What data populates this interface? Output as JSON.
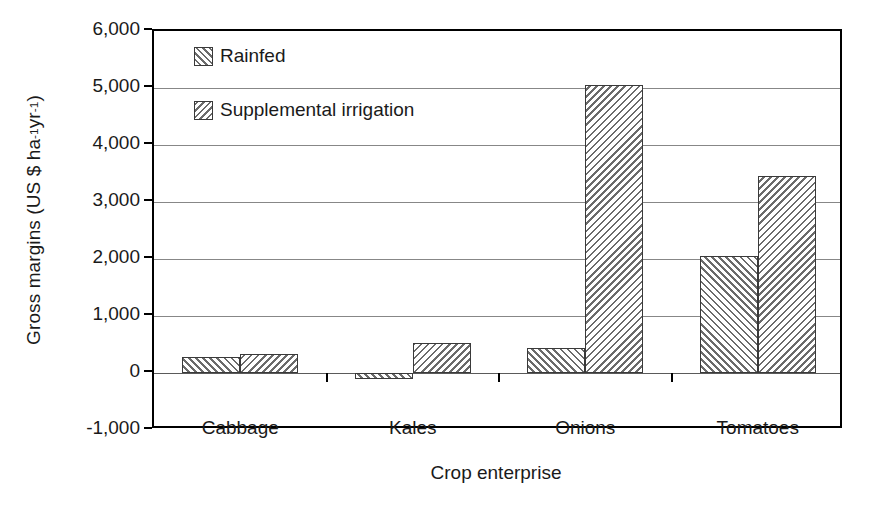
{
  "chart_data": {
    "type": "bar",
    "title": "",
    "xlabel": "Crop enterprise",
    "ylabel": "Gross margins (US $ ha-1 yr-1)",
    "ylabel_parts": {
      "prefix": "Gross margins (US $ ha",
      "sup1": "-1",
      "mid": " yr",
      "sup2": "-1",
      "suffix": ")"
    },
    "categories": [
      "Cabbage",
      "Kales",
      "Onions",
      "Tomatoes"
    ],
    "series": [
      {
        "name": "Rainfed",
        "values": [
          280,
          -110,
          440,
          2060
        ]
      },
      {
        "name": "Supplemental irrigation",
        "values": [
          340,
          520,
          5060,
          3450
        ]
      }
    ],
    "ylim": [
      -1000,
      6000
    ],
    "ytick_values": [
      -1000,
      0,
      1000,
      2000,
      3000,
      4000,
      5000,
      6000
    ],
    "ytick_labels": [
      "-1,000",
      "0",
      "1,000",
      "2,000",
      "3,000",
      "4,000",
      "5,000",
      "6,000"
    ],
    "grid": true,
    "legend_position": "top-left-inside",
    "colors": {
      "axis": "#000000",
      "grid": "#878787",
      "bar_outline": "#3a3a3a",
      "hatch": "#6b6b6b",
      "background": "#ffffff"
    }
  },
  "legend": {
    "items": [
      {
        "label": "Rainfed",
        "pattern": "forward-hatch"
      },
      {
        "label": "Supplemental irrigation",
        "pattern": "back-hatch"
      }
    ]
  }
}
